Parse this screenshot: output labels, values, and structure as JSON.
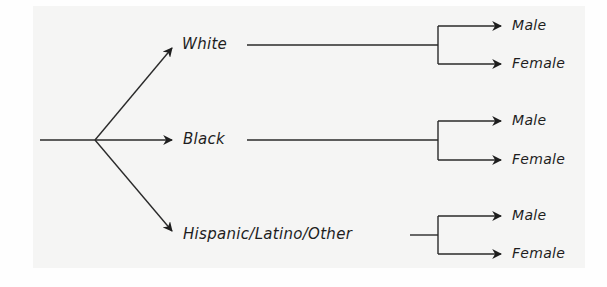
{
  "diagram": {
    "type": "tree",
    "colors": {
      "ink": "#1e1e1e",
      "panel": "#f5f5f4",
      "background": "#fefefe"
    },
    "categories": [
      {
        "label": "White",
        "children": [
          "Male",
          "Female"
        ]
      },
      {
        "label": "Black",
        "children": [
          "Male",
          "Female"
        ]
      },
      {
        "label": "Hispanic/Latino/Other",
        "children": [
          "Male",
          "Female"
        ]
      }
    ]
  }
}
